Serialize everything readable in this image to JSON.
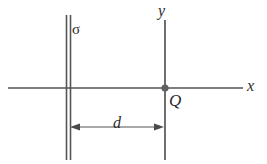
{
  "figure": {
    "stroke_color": "#555555",
    "text_color": "#2b2b2b",
    "background": "#ffffff",
    "labels": {
      "sheet_charge_density": "σ",
      "y_axis": "y",
      "x_axis": "x",
      "point_charge": "Q",
      "distance": "d"
    },
    "geometry": {
      "sheet_x": 68,
      "sheet_top_y": 15,
      "sheet_bottom_y": 160,
      "axis_y": 88,
      "x_axis_start": 8,
      "x_axis_end": 243,
      "y_axis_x": 165,
      "y_axis_top": 20,
      "y_axis_bottom": 160,
      "charge_point": [
        165,
        88
      ],
      "dimension_line_y": 127,
      "dimension_from_x": 70,
      "dimension_to_x": 165
    }
  }
}
